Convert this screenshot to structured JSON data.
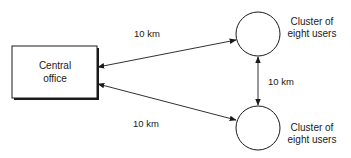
{
  "diagram": {
    "type": "network-topology",
    "nodes": {
      "central_office": {
        "line1": "Central",
        "line2": "office"
      },
      "cluster_top": {
        "line1": "Cluster of",
        "line2": "eight users"
      },
      "cluster_bottom": {
        "line1": "Cluster of",
        "line2": "eight users"
      }
    },
    "edges": {
      "office_to_top": {
        "label": "10 km"
      },
      "office_to_bottom": {
        "label": "10 km"
      },
      "top_to_bottom": {
        "label": "10 km"
      }
    },
    "colors": {
      "stroke": "#1a1a1a",
      "fill": "#ffffff"
    }
  }
}
